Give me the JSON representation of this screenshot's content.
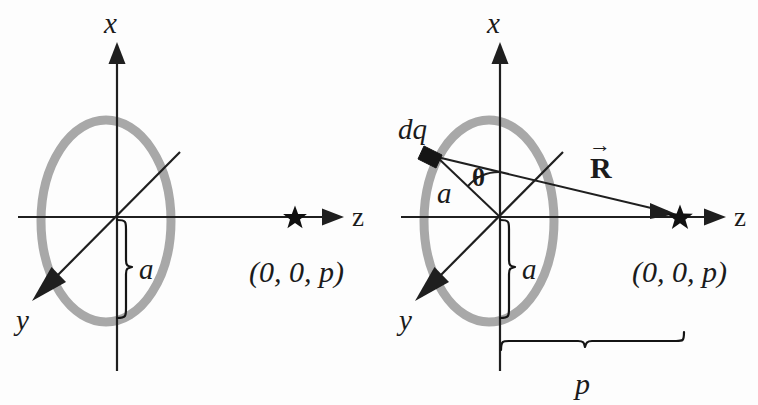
{
  "figure": {
    "background_color": "#fdfdfd",
    "ring_color": "#a8a8a8",
    "line_color": "#1f1f1f",
    "marker_color": "#101010"
  },
  "panels": [
    {
      "id": "left",
      "name": "ring-geometry-panel",
      "axes": {
        "x_label": "x",
        "y_label": "y",
        "z_label": "z"
      },
      "labels": {
        "radius": "a",
        "field_point": "(0, 0, p)"
      },
      "markers": {
        "field_point_glyph": "star"
      }
    },
    {
      "id": "right",
      "name": "charge-element-panel",
      "axes": {
        "x_label": "x",
        "y_label": "y",
        "z_label": "z"
      },
      "labels": {
        "charge_element": "dq",
        "angle": "θ",
        "radius_slant": "a",
        "radius": "a",
        "distance_vector": "R",
        "distance_vector_accent": "→",
        "field_point": "(0, 0, p)",
        "axial_distance": "p"
      },
      "markers": {
        "field_point_glyph": "star",
        "charge_element_glyph": "filled-parallelogram"
      }
    }
  ]
}
